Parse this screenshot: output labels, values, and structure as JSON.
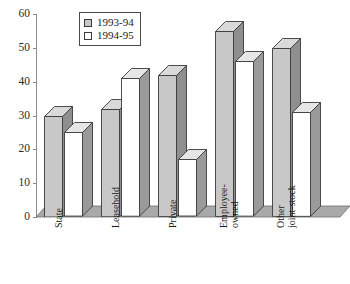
{
  "chart_data": {
    "type": "bar",
    "title": "",
    "xlabel": "",
    "ylabel": "",
    "ylim": [
      0,
      60
    ],
    "yticks": [
      0,
      10,
      20,
      30,
      40,
      50,
      60
    ],
    "grid": false,
    "legend_position": "top-left",
    "categories": [
      "State",
      "Leasehold",
      "Private",
      "Employee-owned",
      "Other joint-stock"
    ],
    "category_lines": [
      [
        "State"
      ],
      [
        "Leasehold"
      ],
      [
        "Private"
      ],
      [
        "Employee-",
        "owned"
      ],
      [
        "Other",
        "joint-stock"
      ]
    ],
    "series": [
      {
        "name": "1993-94",
        "color": "#c8c8c8",
        "values": [
          30,
          32,
          42,
          55,
          50
        ]
      },
      {
        "name": "1994-95",
        "color": "#ffffff",
        "values": [
          25,
          41,
          17,
          46,
          31
        ]
      }
    ]
  },
  "legend": {
    "entries": [
      {
        "label": "1993-94",
        "swatch": "#c8c8c8"
      },
      {
        "label": "1994-95",
        "swatch": "#ffffff"
      }
    ]
  },
  "colors": {
    "series_1_front": "#c8c8c8",
    "series_1_side": "#8f8f8f",
    "series_1_top": "#d9d9d9",
    "series_2_front": "#ffffff",
    "series_2_side": "#9a9a9a",
    "series_2_top": "#e6e6e6",
    "floor": "#a9a9a9",
    "axis": "#8d8d8d",
    "outline": "#3a3a3a"
  }
}
